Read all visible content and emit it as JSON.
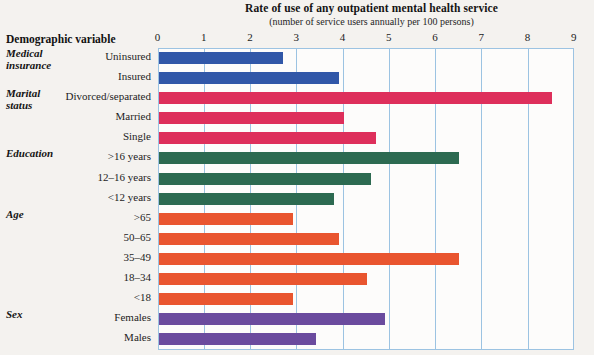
{
  "header": {
    "variable_column_label": "Demographic variable"
  },
  "chart_data": {
    "type": "bar",
    "orientation": "horizontal",
    "title": "Rate of use of any outpatient mental health service",
    "subtitle": "(number of service users annually per 100 persons)",
    "xlabel": "",
    "ylabel": "Demographic variable",
    "xlim": [
      0,
      9
    ],
    "xticks": [
      0,
      1,
      2,
      3,
      4,
      5,
      6,
      7,
      8,
      9
    ],
    "tick_labels": [
      "0",
      "1",
      "2",
      "3",
      "4",
      "5",
      "6",
      "7",
      "8",
      "9"
    ],
    "grid": true,
    "legend": "none",
    "groups": [
      {
        "name": "Medical\ninsurance",
        "color": "#3157a8",
        "categories": [
          "Uninsured",
          "Insured"
        ],
        "values": [
          2.7,
          3.9
        ]
      },
      {
        "name": "Marital\nstatus",
        "color": "#de2f5b",
        "categories": [
          "Divorced/separated",
          "Married",
          "Single"
        ],
        "values": [
          8.5,
          4.0,
          4.7
        ]
      },
      {
        "name": "Education",
        "color": "#2d6a51",
        "categories": [
          ">16 years",
          "12–16 years",
          "<12 years"
        ],
        "values": [
          6.5,
          4.6,
          3.8
        ]
      },
      {
        "name": "Age",
        "color": "#e9552f",
        "categories": [
          ">65",
          "50–65",
          "35–49",
          "18–34",
          "<18"
        ],
        "values": [
          2.9,
          3.9,
          6.5,
          4.5,
          2.9
        ]
      },
      {
        "name": "Sex",
        "color": "#6b4b9e",
        "categories": [
          "Females",
          "Males"
        ],
        "values": [
          4.9,
          3.4
        ]
      }
    ]
  },
  "colors": {
    "medical_insurance": "#3157a8",
    "marital_status": "#de2f5b",
    "education": "#2d6a51",
    "age": "#e9552f",
    "sex": "#6b4b9e",
    "grid": "#9cc3e2",
    "page_background": "#f3f1ee",
    "plot_background": "#fdfcfb"
  }
}
